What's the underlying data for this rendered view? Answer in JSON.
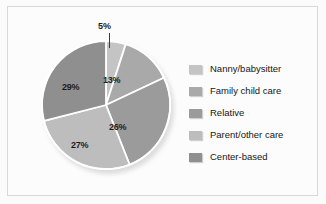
{
  "figure": {
    "background_color": "#fbfbfb",
    "frame_color": "#d8d8d8"
  },
  "chart_data": {
    "type": "pie",
    "title": "",
    "xlabel": "",
    "ylabel": "",
    "legend_position": "right",
    "grid": false,
    "start_angle_deg": 0,
    "direction": "clockwise",
    "categories": [
      "Nanny/babysitter",
      "Family child care",
      "Relative",
      "Parent/other care",
      "Center-based"
    ],
    "values": [
      5,
      13,
      26,
      27,
      29
    ],
    "value_labels": [
      "5%",
      "13%",
      "26%",
      "27%",
      "29%"
    ],
    "colors": [
      "#c4c4c4",
      "#a9a9a9",
      "#9b9b9b",
      "#bdbdbd",
      "#8f8f8f"
    ],
    "slice_separator_color": "#ffffff",
    "annotations": [
      {
        "text": "5%",
        "kind": "callout-leader-line",
        "target_slice": "Nanny/babysitter"
      }
    ]
  },
  "slice_labels": {
    "nanny": "5%",
    "family": "13%",
    "relative": "26%",
    "parent": "27%",
    "center": "29%"
  },
  "legend": {
    "items": [
      {
        "label": "Nanny/babysitter",
        "color": "#c4c4c4"
      },
      {
        "label": "Family child care",
        "color": "#a9a9a9"
      },
      {
        "label": "Relative",
        "color": "#9b9b9b"
      },
      {
        "label": "Parent/other care",
        "color": "#bdbdbd"
      },
      {
        "label": "Center-based",
        "color": "#8f8f8f"
      }
    ]
  }
}
